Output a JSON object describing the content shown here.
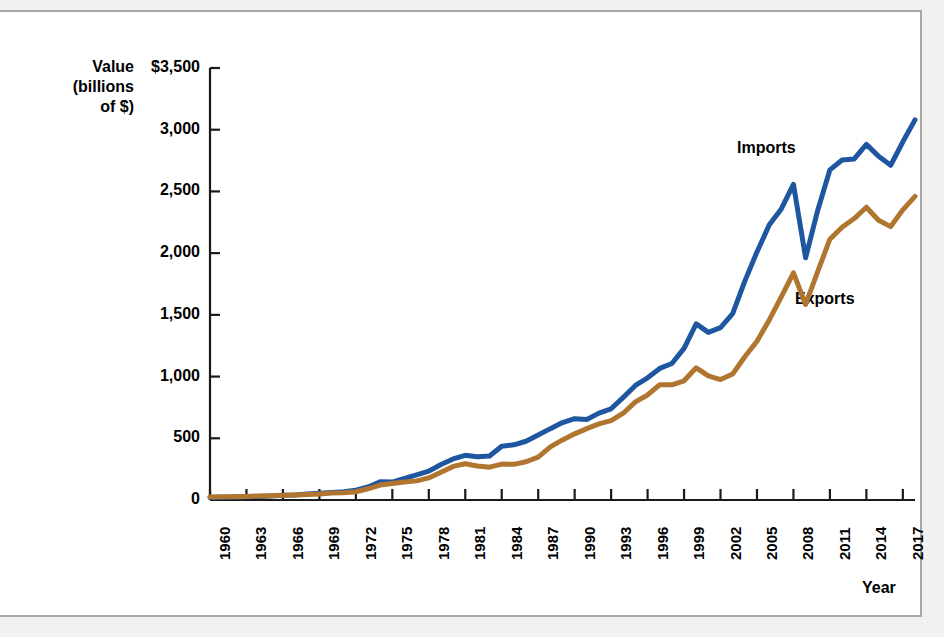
{
  "figure": {
    "value_axis_title": "Value\n(billions\nof $)",
    "year_axis_title": "Year",
    "imports_label": "Imports",
    "exports_label": "Exports",
    "colors": {
      "imports": "#1F56A0",
      "exports": "#B0762F",
      "axis": "#1a1a1a",
      "frame": "#a9a7a3",
      "background": "#ffffff"
    }
  },
  "chart_data": {
    "type": "line",
    "title": "",
    "subtitle": "",
    "xlabel": "Year",
    "ylabel": "Value (billions of $)",
    "xlim": [
      1960,
      2018
    ],
    "ylim": [
      0,
      3500
    ],
    "grid": false,
    "legend_position": "inline-annotation",
    "y_ticks": [
      0,
      500,
      1000,
      1500,
      2000,
      2500,
      3000,
      3500
    ],
    "y_tick_labels": [
      "0",
      "500",
      "1,000",
      "1,500",
      "2,000",
      "2,500",
      "3,000",
      "$3,500"
    ],
    "x_ticks": [
      1960,
      1963,
      1966,
      1969,
      1972,
      1975,
      1978,
      1981,
      1984,
      1987,
      1990,
      1993,
      1996,
      1999,
      2002,
      2005,
      2008,
      2011,
      2014,
      2017
    ],
    "x_tick_labels": [
      "1960",
      "1963",
      "1966",
      "1969",
      "1972",
      "1975",
      "1978",
      "1981",
      "1984",
      "1987",
      "1990",
      "1993",
      "1996",
      "1999",
      "2002",
      "2005",
      "2008",
      "2011",
      "2014",
      "2017"
    ],
    "x": [
      1960,
      1961,
      1962,
      1963,
      1964,
      1965,
      1966,
      1967,
      1968,
      1969,
      1970,
      1971,
      1972,
      1973,
      1974,
      1975,
      1976,
      1977,
      1978,
      1979,
      1980,
      1981,
      1982,
      1983,
      1984,
      1985,
      1986,
      1987,
      1988,
      1989,
      1990,
      1991,
      1992,
      1993,
      1994,
      1995,
      1996,
      1997,
      1998,
      1999,
      2000,
      2001,
      2002,
      2003,
      2004,
      2005,
      2006,
      2007,
      2008,
      2009,
      2010,
      2011,
      2012,
      2013,
      2014,
      2015,
      2016,
      2017,
      2018
    ],
    "series": [
      {
        "name": "Imports",
        "color": "#1F56A0",
        "values": [
          23,
          23,
          25,
          27,
          29,
          32,
          38,
          41,
          49,
          54,
          60,
          67,
          79,
          105,
          148,
          145,
          175,
          204,
          234,
          288,
          333,
          362,
          350,
          357,
          436,
          447,
          476,
          526,
          578,
          627,
          659,
          652,
          704,
          739,
          832,
          928,
          990,
          1066,
          1106,
          1228,
          1427,
          1358,
          1397,
          1510,
          1773,
          2010,
          2227,
          2358,
          2557,
          1962,
          2348,
          2675,
          2755,
          2763,
          2881,
          2786,
          2712,
          2902,
          3080
        ]
      },
      {
        "name": "Exports",
        "color": "#B0762F",
        "values": [
          25,
          26,
          27,
          29,
          33,
          35,
          38,
          41,
          45,
          49,
          57,
          59,
          67,
          91,
          121,
          133,
          145,
          155,
          179,
          224,
          272,
          294,
          275,
          266,
          291,
          289,
          310,
          348,
          430,
          487,
          536,
          578,
          617,
          643,
          703,
          795,
          851,
          934,
          933,
          966,
          1071,
          1006,
          976,
          1021,
          1161,
          1286,
          1457,
          1646,
          1841,
          1584,
          1853,
          2113,
          2210,
          2280,
          2372,
          2266,
          2215,
          2351,
          2460
        ]
      }
    ],
    "annotations": [
      {
        "text": "Imports",
        "x": 2003,
        "y": 2680
      },
      {
        "text": "Exports",
        "x": 2007,
        "y": 1490
      }
    ]
  }
}
